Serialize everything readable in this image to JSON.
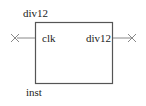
{
  "symbol": {
    "name": "div12",
    "instance": "inst",
    "ports": {
      "input": "clk",
      "output": "div12"
    }
  },
  "colors": {
    "box": "#555555",
    "wire": "#888888",
    "marker": "#888888"
  }
}
